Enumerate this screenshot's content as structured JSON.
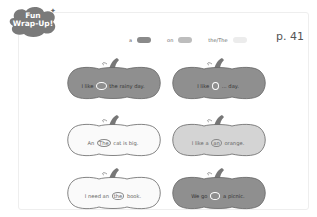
{
  "badge": {
    "line1": "Fun",
    "line2": "Wrap-Up!"
  },
  "legend": [
    {
      "label": "a",
      "color": "#8a8a8a"
    },
    {
      "label": "on",
      "color": "#bdbdbd"
    },
    {
      "label": "the/The",
      "color": "#e6e6e6"
    }
  ],
  "page_number": "p. 41",
  "pumpkins": [
    {
      "style": "dark",
      "before": "I like",
      "circled": "on",
      "after": "the rainy day."
    },
    {
      "style": "dark",
      "before": "I like",
      "circled": "a",
      "after": "... day."
    },
    {
      "style": "light",
      "before": "An",
      "circled": "The",
      "after": "cat is big."
    },
    {
      "style": "mid",
      "before": "I like a",
      "circled": "an",
      "after": "orange."
    },
    {
      "style": "light",
      "before": "I need an",
      "circled": "the",
      "after": "book."
    },
    {
      "style": "dark",
      "before": "We go",
      "circled": "on",
      "after": "a picnic."
    }
  ]
}
